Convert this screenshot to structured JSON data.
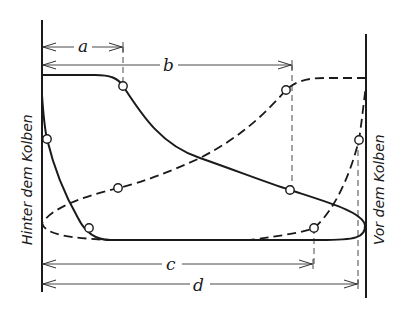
{
  "diagram": {
    "left_label": "Hinter dem Kolben",
    "right_label": "Vor dem Kolben",
    "dimensions": [
      {
        "label": "a",
        "from_x": 42,
        "to_x": 123,
        "y": 47
      },
      {
        "label": "b",
        "from_x": 42,
        "to_x": 292,
        "y": 65
      },
      {
        "label": "c",
        "from_x": 42,
        "to_x": 313,
        "y": 264
      },
      {
        "label": "d",
        "from_x": 42,
        "to_x": 358,
        "y": 284
      }
    ],
    "curves": {
      "solid": "pressure behind piston (solid line)",
      "dashed": "pressure in front of piston (dashed line)"
    },
    "markers": [
      {
        "x": 123,
        "y": 86
      },
      {
        "x": 47,
        "y": 139
      },
      {
        "x": 89,
        "y": 228
      },
      {
        "x": 290,
        "y": 190
      },
      {
        "x": 118,
        "y": 188
      },
      {
        "x": 286,
        "y": 90
      },
      {
        "x": 359,
        "y": 140
      },
      {
        "x": 314,
        "y": 228
      }
    ]
  }
}
